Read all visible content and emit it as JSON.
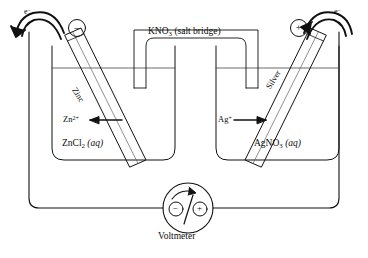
{
  "figure": {
    "kind": "galvanic-cell-diagram",
    "stroke_color": "#111111",
    "background_color": "#ffffff"
  },
  "salt_bridge": {
    "formula": "KNO",
    "formula_sub": "3",
    "descriptor": "(salt bridge)"
  },
  "left_half_cell": {
    "electrode_label": "Zinc",
    "solution_formula": "ZnCl",
    "solution_sub": "2",
    "solution_state": "(aq)",
    "ion_symbol": "Zn",
    "ion_charge": "2+",
    "terminal_sign": "−",
    "electron_label": "e",
    "electron_charge": "−"
  },
  "right_half_cell": {
    "electrode_label": "Silver",
    "solution_formula": "AgNO",
    "solution_sub": "3",
    "solution_state": "(aq)",
    "ion_symbol": "Ag",
    "ion_charge": "+",
    "terminal_sign": "+",
    "electron_label": "e",
    "electron_charge": "−"
  },
  "meter": {
    "label": "Voltmeter",
    "negative_terminal": "−",
    "positive_terminal": "+"
  }
}
